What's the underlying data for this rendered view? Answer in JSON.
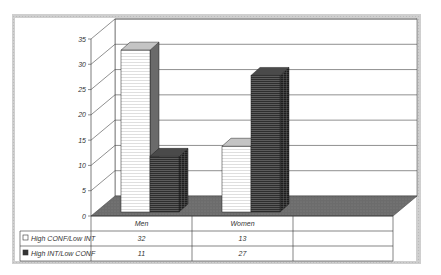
{
  "chart_data": {
    "type": "bar",
    "style": "3d-clustered-column-with-data-table",
    "title": "",
    "xlabel": "",
    "ylabel": "",
    "categories": [
      "Men",
      "Women"
    ],
    "series": [
      {
        "name": "High CONF/Low INT",
        "values": [
          32,
          13
        ],
        "fill": "#ffffff",
        "pattern": "light-horizontal-lines"
      },
      {
        "name": "High INT/Low CONF",
        "values": [
          11,
          27
        ],
        "fill": "#3a3a3a",
        "pattern": "dark-horizontal-lines"
      }
    ],
    "ylim": [
      0,
      35
    ],
    "yticks": [
      0,
      5,
      10,
      15,
      20,
      25,
      30,
      35
    ],
    "grid": true,
    "legend": "data-table-left",
    "data_table": {
      "headers": [
        "Men",
        "Women",
        ""
      ],
      "rows": [
        {
          "label": "High CONF/Low INT",
          "cells": [
            "32",
            "13",
            ""
          ]
        },
        {
          "label": "High INT/Low CONF",
          "cells": [
            "11",
            "27",
            ""
          ]
        }
      ]
    },
    "colors": {
      "frame": "#c8c8c8",
      "floor": "#6e6e6e",
      "grid": "#444444"
    }
  }
}
